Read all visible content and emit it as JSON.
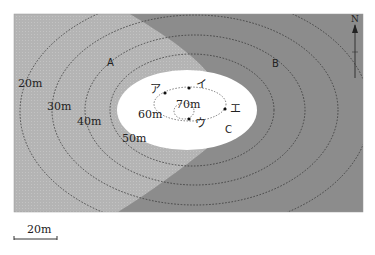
{
  "figure": {
    "type": "contour-map",
    "colors": {
      "region_a": "#b4b4b4",
      "region_b": "#8c8c8c",
      "region_c": "#ffffff",
      "contour": "#333333"
    },
    "regions": [
      {
        "id": "A",
        "label": "A"
      },
      {
        "id": "B",
        "label": "B"
      },
      {
        "id": "C",
        "label": "C"
      }
    ],
    "contours": [
      {
        "label": "20m",
        "elevation": 20
      },
      {
        "label": "30m",
        "elevation": 30
      },
      {
        "label": "40m",
        "elevation": 40
      },
      {
        "label": "50m",
        "elevation": 50
      },
      {
        "label": "60m",
        "elevation": 60
      },
      {
        "label": "70m",
        "elevation": 70
      }
    ],
    "points": [
      {
        "id": "a",
        "label": "ア"
      },
      {
        "id": "i",
        "label": "イ"
      },
      {
        "id": "u",
        "label": "ウ"
      },
      {
        "id": "e",
        "label": "エ"
      }
    ],
    "north_label": "N",
    "scale_bar": {
      "label": "20m"
    }
  }
}
